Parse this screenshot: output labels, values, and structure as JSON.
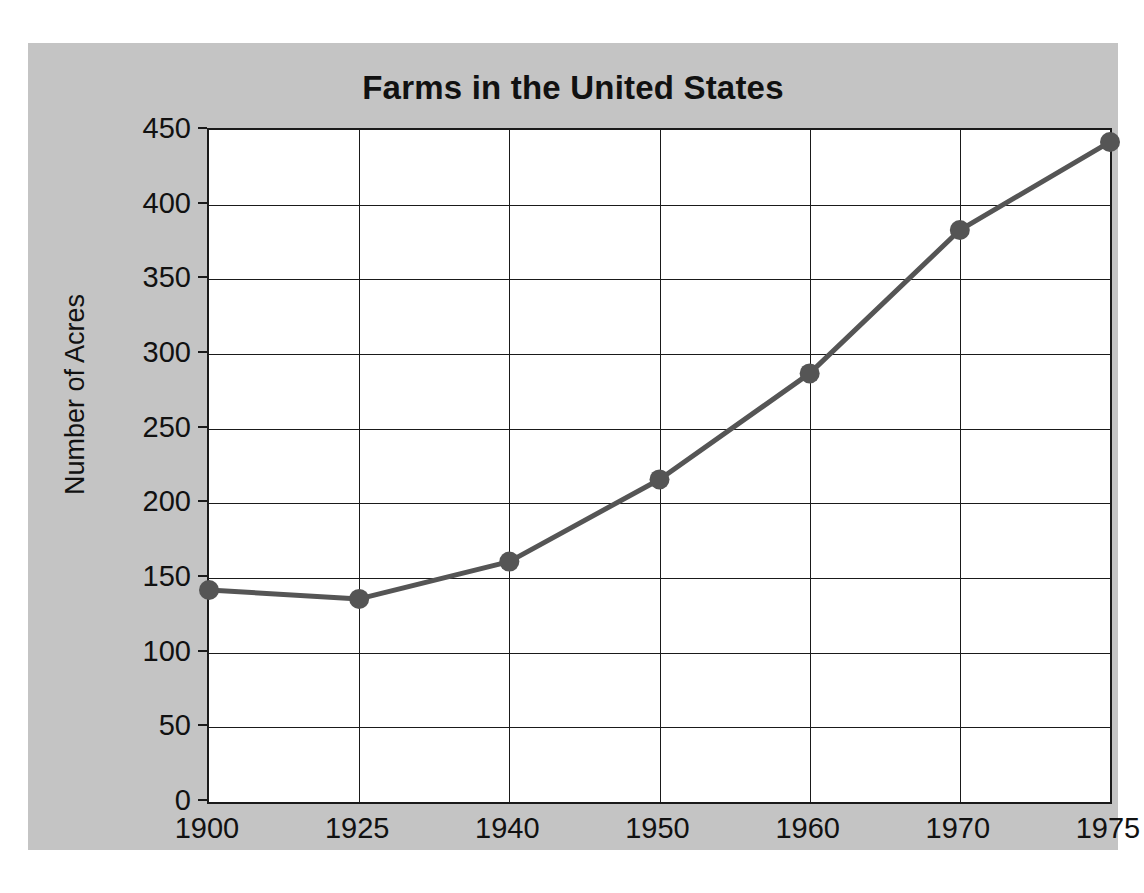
{
  "figure": {
    "panel_background": "#c4c4c4",
    "page_background": "#ffffff",
    "plot_background": "#ffffff",
    "axis_color": "#1a1a1a",
    "series_color": "#555555"
  },
  "chart_data": {
    "type": "line",
    "title": "Farms in the United States",
    "xlabel": "",
    "ylabel": "Number of Acres",
    "categories": [
      "1900",
      "1925",
      "1940",
      "1950",
      "1960",
      "1970",
      "1975"
    ],
    "x": [
      1900,
      1925,
      1940,
      1950,
      1960,
      1970,
      1975
    ],
    "values": [
      142,
      136,
      161,
      216,
      287,
      383,
      442
    ],
    "series": [
      {
        "name": "Number of Acres",
        "values": [
          142,
          136,
          161,
          216,
          287,
          383,
          442
        ]
      }
    ],
    "ylim": [
      0,
      450
    ],
    "yticks": [
      0,
      50,
      100,
      150,
      200,
      250,
      300,
      350,
      400,
      450
    ],
    "ytick_labels": [
      "0",
      "50",
      "100",
      "150",
      "200",
      "250",
      "300",
      "350",
      "400",
      "450"
    ],
    "xtick_labels": [
      "1900",
      "1925",
      "1940",
      "1950",
      "1960",
      "1970",
      "1975"
    ],
    "grid": true,
    "grid_axis": "both",
    "legend": false,
    "legend_position": "none",
    "marker": "circle",
    "marker_color": "#555555",
    "line_color": "#555555",
    "line_width": 5
  }
}
